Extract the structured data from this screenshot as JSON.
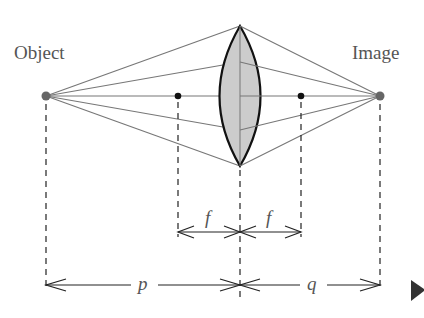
{
  "labels": {
    "object": "Object",
    "image": "Image",
    "focal_left": "f",
    "focal_right": "f",
    "object_distance": "p",
    "image_distance": "q"
  },
  "geometry": {
    "axis_y": 96,
    "object_x": 46,
    "image_x": 380,
    "lens_x": 240,
    "lens_top_y": 26,
    "lens_bottom_y": 166,
    "focal_left_x": 178,
    "focal_right_x": 301,
    "ray_lens_hits_y": [
      26,
      62,
      96,
      130,
      166
    ],
    "f_dimension_y": 232,
    "pq_dimension_y": 285
  },
  "colors": {
    "rays": "#777777",
    "lens_fill": "#cccccc",
    "lens_outline": "#111111",
    "points": "#666666",
    "focal_points": "#111111",
    "dimension_lines": "#222222",
    "play_marker": "#333333"
  },
  "controls": {
    "next_marker": "next"
  }
}
